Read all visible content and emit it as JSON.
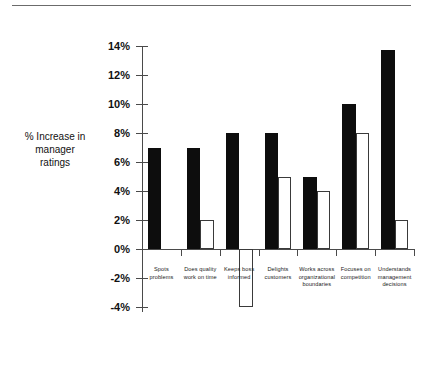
{
  "chart_data": {
    "type": "bar",
    "title": "",
    "subtitle": "",
    "xlabel": "",
    "ylabel": "% Increase in manager ratings",
    "ylabel_lines": [
      "% Increase in",
      "manager",
      "ratings"
    ],
    "ylim": [
      -4,
      14
    ],
    "ytick_step": 2,
    "ytick_labels": [
      "14%",
      "12%",
      "10%",
      "8%",
      "6%",
      "4%",
      "2%",
      "0%",
      "-2%",
      "-4%"
    ],
    "ytick_values": [
      14,
      12,
      10,
      8,
      6,
      4,
      2,
      0,
      -2,
      -4
    ],
    "grid": false,
    "legend": "none",
    "categories": [
      "Spots problems",
      "Does quality work on time",
      "Keeps boss informed",
      "Delights customers",
      "Works across organizational boundaries",
      "Focuses on competition",
      "Understands management decisions"
    ],
    "category_lines": [
      [
        "Spots",
        "problems"
      ],
      [
        "Does quality",
        "work on time"
      ],
      [
        "Keeps boss",
        "informed"
      ],
      [
        "Delights",
        "customers"
      ],
      [
        "Works across",
        "organizational",
        "boundaries"
      ],
      [
        "Focuses on",
        "competition"
      ],
      [
        "Understands",
        "management",
        "decisions"
      ]
    ],
    "series": [
      {
        "name": "primary",
        "fill": "#0d0d0d",
        "values": [
          7,
          7,
          8,
          8,
          5,
          10,
          13.7
        ]
      },
      {
        "name": "secondary",
        "fill": "#ffffff",
        "values": [
          null,
          2,
          -4,
          5,
          4,
          8,
          2
        ]
      }
    ]
  },
  "colors": {
    "primary_bar": "#0d0d0d",
    "secondary_bar": "#ffffff",
    "secondary_border": "#3a3a3a",
    "axis": "#4a4a4a",
    "text": "#111111",
    "rule": "#6b6b6b",
    "background": "#ffffff"
  }
}
